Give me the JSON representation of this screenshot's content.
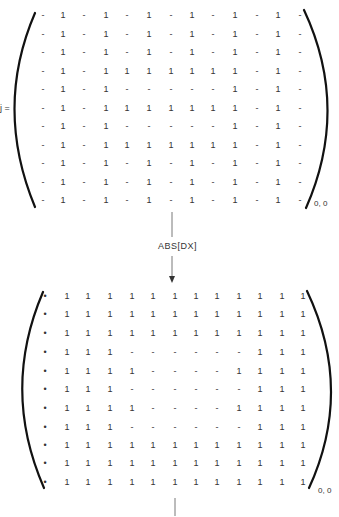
{
  "equation_label": "j =",
  "operation_label": "ABS[DX]",
  "matrix_top": {
    "subscript": "0, 0",
    "row_y": [
      15,
      34,
      52,
      71,
      89,
      108,
      126,
      145,
      163,
      182,
      200
    ],
    "col_x": [
      43,
      63,
      84,
      106,
      127,
      149,
      171,
      192,
      213,
      235,
      257,
      278,
      300
    ],
    "rows": [
      [
        "-",
        "1",
        "-",
        "1",
        "-",
        "1",
        "-",
        "1",
        "-",
        "1",
        "-",
        "1",
        "-"
      ],
      [
        "-",
        "1",
        "-",
        "1",
        "-",
        "1",
        "-",
        "1",
        "-",
        "1",
        "-",
        "1",
        "-"
      ],
      [
        "-",
        "1",
        "-",
        "1",
        "-",
        "1",
        "-",
        "1",
        "-",
        "1",
        "-",
        "1",
        "-"
      ],
      [
        "-",
        "1",
        "-",
        "1",
        "1",
        "1",
        "1",
        "1",
        "1",
        "1",
        "-",
        "1",
        "-"
      ],
      [
        "-",
        "1",
        "-",
        "1",
        "-",
        "-",
        "-",
        "-",
        "-",
        "1",
        "-",
        "1",
        "-"
      ],
      [
        "-",
        "1",
        "-",
        "1",
        "1",
        "1",
        "1",
        "1",
        "1",
        "1",
        "-",
        "1",
        "-"
      ],
      [
        "-",
        "1",
        "-",
        "1",
        "-",
        "-",
        "-",
        "-",
        "-",
        "1",
        "-",
        "1",
        "-"
      ],
      [
        "-",
        "1",
        "-",
        "1",
        "1",
        "1",
        "1",
        "1",
        "1",
        "1",
        "-",
        "1",
        "-"
      ],
      [
        "-",
        "1",
        "-",
        "1",
        "-",
        "1",
        "-",
        "1",
        "-",
        "1",
        "-",
        "1",
        "-"
      ],
      [
        "-",
        "1",
        "-",
        "1",
        "-",
        "1",
        "-",
        "1",
        "-",
        "1",
        "-",
        "1",
        "-"
      ],
      [
        "-",
        "1",
        "-",
        "1",
        "-",
        "1",
        "-",
        "1",
        "-",
        "1",
        "-",
        "1",
        "-"
      ]
    ]
  },
  "matrix_bottom": {
    "subscript": "0, 0",
    "row_y": [
      296,
      314,
      333,
      352,
      371,
      389,
      408,
      427,
      445,
      463,
      482
    ],
    "col_x": [
      45,
      67,
      88,
      110,
      132,
      153,
      175,
      196,
      217,
      239,
      260,
      282,
      303
    ],
    "rows": [
      [
        "•",
        "1",
        "1",
        "1",
        "1",
        "1",
        "1",
        "1",
        "1",
        "1",
        "1",
        "1",
        "1"
      ],
      [
        "•",
        "1",
        "1",
        "1",
        "1",
        "1",
        "1",
        "1",
        "1",
        "1",
        "1",
        "1",
        "1"
      ],
      [
        "•",
        "1",
        "1",
        "1",
        "1",
        "1",
        "1",
        "1",
        "1",
        "1",
        "1",
        "1",
        "1"
      ],
      [
        "•",
        "1",
        "1",
        "1",
        "-",
        "-",
        "-",
        "-",
        "-",
        "-",
        "1",
        "1",
        "1"
      ],
      [
        "•",
        "1",
        "1",
        "1",
        "1",
        "-",
        "-",
        "-",
        "-",
        "1",
        "1",
        "1",
        "1"
      ],
      [
        "•",
        "1",
        "1",
        "1",
        "-",
        "-",
        "-",
        "-",
        "-",
        "-",
        "1",
        "1",
        "1"
      ],
      [
        "•",
        "1",
        "1",
        "1",
        "1",
        "-",
        "-",
        "-",
        "-",
        "1",
        "1",
        "1",
        "1"
      ],
      [
        "•",
        "1",
        "1",
        "1",
        "-",
        "-",
        "-",
        "-",
        "-",
        "-",
        "1",
        "1",
        "1"
      ],
      [
        "•",
        "1",
        "1",
        "1",
        "1",
        "1",
        "1",
        "1",
        "1",
        "1",
        "1",
        "1",
        "1"
      ],
      [
        "•",
        "1",
        "1",
        "1",
        "1",
        "1",
        "1",
        "1",
        "1",
        "1",
        "1",
        "1",
        "1"
      ],
      [
        "•",
        "1",
        "1",
        "1",
        "1",
        "1",
        "1",
        "1",
        "1",
        "1",
        "1",
        "1",
        "1"
      ]
    ]
  },
  "icons": {
    "arrow": "down-arrow",
    "bracket": "parenthesis"
  },
  "colors": {
    "ink": "#222222",
    "background": "#ffffff"
  }
}
